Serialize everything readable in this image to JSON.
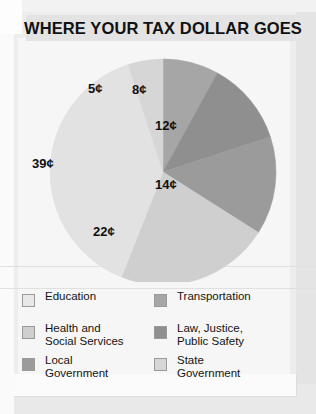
{
  "header": {
    "title": "WHERE YOUR TAX DOLLAR GOES"
  },
  "chart_data": {
    "type": "pie",
    "title": "WHERE YOUR TAX DOLLAR GOES",
    "unit": "cents",
    "total": 100,
    "legend_position": "bottom",
    "grid": false,
    "categories": [
      "Transportation",
      "Law, Justice, Public Safety",
      "Local Government",
      "Health and Social Services",
      "Education",
      "State Government"
    ],
    "values": [
      8,
      12,
      14,
      22,
      39,
      5
    ],
    "data_labels": [
      "8¢",
      "12¢",
      "14¢",
      "22¢",
      "39¢",
      "5¢"
    ],
    "colors": [
      "#a6a6a6",
      "#8f8f8f",
      "#9b9b9b",
      "#cfcfcf",
      "#e2e2e2",
      "#d6d6d6"
    ],
    "slices": [
      {
        "label": "8¢",
        "category": "Transportation",
        "value": 8,
        "color": "#a6a6a6",
        "start_deg": 0,
        "end_deg": 28.8,
        "label_x": 118,
        "label_y": 36
      },
      {
        "label": "12¢",
        "category": "Law, Justice, Public Safety",
        "value": 12,
        "color": "#8f8f8f",
        "start_deg": 28.8,
        "end_deg": 72.0,
        "label_x": 141,
        "label_y": 72
      },
      {
        "label": "14¢",
        "category": "Local Government",
        "value": 14,
        "color": "#9b9b9b",
        "start_deg": 72.0,
        "end_deg": 122.4,
        "label_x": 141,
        "label_y": 131
      },
      {
        "label": "22¢",
        "category": "Health and Social Services",
        "value": 22,
        "color": "#cfcfcf",
        "start_deg": 122.4,
        "end_deg": 201.6,
        "label_x": 79,
        "label_y": 178
      },
      {
        "label": "39¢",
        "category": "Education",
        "value": 39,
        "color": "#e2e2e2",
        "start_deg": 201.6,
        "end_deg": 342.0,
        "label_x": 18,
        "label_y": 110
      },
      {
        "label": "5¢",
        "category": "State Government",
        "value": 5,
        "color": "#d6d6d6",
        "start_deg": 342.0,
        "end_deg": 360.0,
        "label_x": 74,
        "label_y": 35
      }
    ]
  },
  "legend": {
    "left_column": [
      {
        "label": "Education",
        "color": "#e8e8e8",
        "value": 39
      },
      {
        "label": "Health and\nSocial Services",
        "color": "#cfcfcf",
        "value": 22
      },
      {
        "label": "Local\nGovernment",
        "color": "#9b9b9b",
        "value": 14
      }
    ],
    "right_column": [
      {
        "label": "Transportation",
        "color": "#a6a6a6",
        "value": 8
      },
      {
        "label": "Law, Justice,\nPublic Safety",
        "color": "#8f8f8f",
        "value": 12
      },
      {
        "label": "State\nGovernment",
        "color": "#d6d6d6",
        "value": 5
      }
    ]
  }
}
